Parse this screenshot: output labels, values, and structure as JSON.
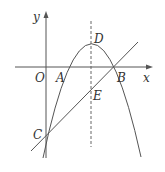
{
  "diagram": {
    "type": "coordinate-geometry",
    "axes": {
      "x_label": "x",
      "y_label": "y",
      "origin_label": "O"
    },
    "points": [
      {
        "label": "A",
        "desc": "left x-intercept of parabola"
      },
      {
        "label": "B",
        "desc": "right x-intercept of parabola, line passes through"
      },
      {
        "label": "C",
        "desc": "y-intercept of parabola and line"
      },
      {
        "label": "D",
        "desc": "vertex of parabola"
      },
      {
        "label": "E",
        "desc": "intersection of line BC and axis of symmetry"
      }
    ],
    "curves": [
      "downward-opening parabola through A, B, C with vertex D",
      "straight line through C and B",
      "dashed axis of symmetry through D and E"
    ],
    "colors": {
      "stroke": "#555555",
      "text": "#333333",
      "background": "#ffffff"
    }
  }
}
